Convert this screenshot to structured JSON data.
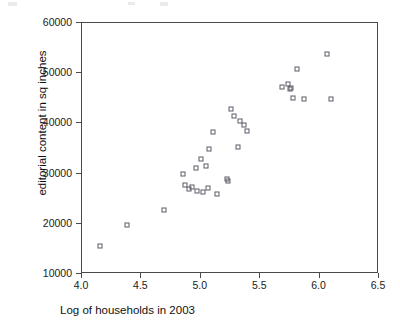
{
  "chart_data": {
    "type": "scatter",
    "title": "",
    "xlabel": "Log of households in 2003",
    "ylabel": "editorial content in sq inches",
    "xlim": [
      4.0,
      6.5
    ],
    "ylim": [
      10000,
      60000
    ],
    "xticks": [
      "4.0",
      "4.5",
      "5.0",
      "5.5",
      "6.0",
      "6.5"
    ],
    "xtick_values": [
      4.0,
      4.5,
      5.0,
      5.5,
      6.0,
      6.5
    ],
    "yticks": [
      "10000",
      "20000",
      "30000",
      "40000",
      "50000",
      "60000"
    ],
    "ytick_values": [
      10000,
      20000,
      30000,
      40000,
      50000,
      60000
    ],
    "grid": false,
    "legend": null,
    "marker": "open-square",
    "marker_color": "#5a5a66",
    "series": [
      {
        "name": "newspapers",
        "points": [
          [
            4.15,
            15600
          ],
          [
            4.38,
            19700
          ],
          [
            4.69,
            22700
          ],
          [
            4.85,
            29900
          ],
          [
            4.87,
            27700
          ],
          [
            4.9,
            26900
          ],
          [
            4.93,
            27400
          ],
          [
            4.96,
            31200
          ],
          [
            4.97,
            26600
          ],
          [
            5.0,
            33000
          ],
          [
            5.02,
            26300
          ],
          [
            5.04,
            31500
          ],
          [
            5.06,
            27100
          ],
          [
            5.07,
            34900
          ],
          [
            5.1,
            38200
          ],
          [
            5.14,
            25900
          ],
          [
            5.22,
            28900
          ],
          [
            5.23,
            28600
          ],
          [
            5.25,
            42800
          ],
          [
            5.28,
            41400
          ],
          [
            5.31,
            35300
          ],
          [
            5.33,
            40400
          ],
          [
            5.36,
            39700
          ],
          [
            5.39,
            38500
          ],
          [
            5.68,
            47200
          ],
          [
            5.73,
            47900
          ],
          [
            5.75,
            46900
          ],
          [
            5.76,
            47000
          ],
          [
            5.78,
            45100
          ],
          [
            5.81,
            50900
          ],
          [
            5.87,
            44800
          ],
          [
            6.06,
            53900
          ],
          [
            6.1,
            44800
          ]
        ]
      }
    ]
  },
  "axes": {
    "x_min": 4.0,
    "x_max": 6.5,
    "y_min": 10000,
    "y_max": 60000
  }
}
